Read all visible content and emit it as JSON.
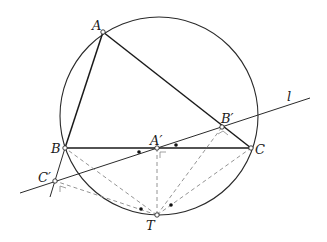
{
  "diagram": {
    "circle": {
      "cx": 159,
      "cy": 116,
      "r": 99
    },
    "points": {
      "A": {
        "label": "A",
        "x": 103,
        "y": 32
      },
      "B": {
        "label": "B",
        "x": 65,
        "y": 148
      },
      "C": {
        "label": "C",
        "x": 251,
        "y": 148
      },
      "A1": {
        "label": "A′",
        "x": 157,
        "y": 148
      },
      "B1": {
        "label": "B′",
        "x": 222,
        "y": 127
      },
      "C1": {
        "label": "C′",
        "x": 55,
        "y": 181
      },
      "T": {
        "label": "T",
        "x": 157,
        "y": 215
      }
    },
    "line_label": "l",
    "colors": {
      "stroke": "#2a2a2a",
      "dashed": "#888888",
      "background": "#ffffff"
    }
  }
}
